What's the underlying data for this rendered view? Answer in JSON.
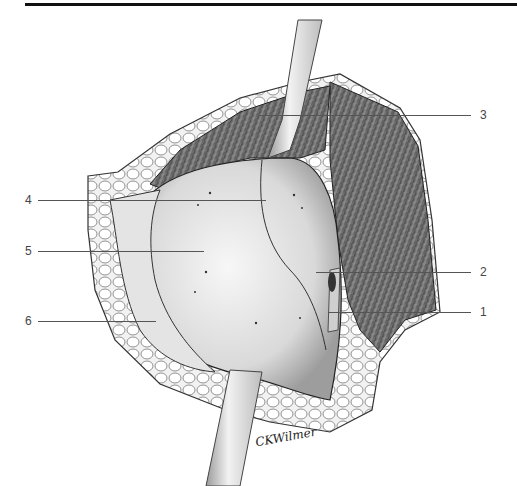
{
  "figure": {
    "type": "surgical anatomical illustration",
    "signature": "CKWilmer",
    "callouts": [
      {
        "number": "1",
        "side": "right",
        "y": 312
      },
      {
        "number": "2",
        "side": "right",
        "y": 272
      },
      {
        "number": "3",
        "side": "right",
        "y": 115
      },
      {
        "number": "4",
        "side": "left",
        "y": 200
      },
      {
        "number": "5",
        "side": "left",
        "y": 251
      },
      {
        "number": "6",
        "side": "left",
        "y": 321
      }
    ]
  },
  "colors": {
    "rule": "#111111",
    "leader": "#555555",
    "label": "#444444",
    "tissue_light": "#e6e6e6",
    "muscle_dark": "#6e6e6e",
    "fat": "#f2f2f2"
  }
}
